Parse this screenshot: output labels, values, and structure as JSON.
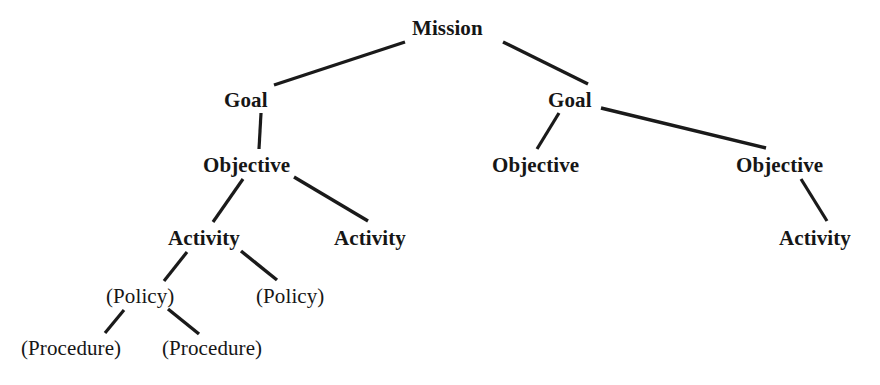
{
  "diagram": {
    "type": "tree",
    "line_color": "#1a1a1a",
    "text_color": "#161616",
    "background_color": "#ffffff",
    "levels": [
      "Mission",
      "Goal",
      "Objective",
      "Activity",
      "(Policy)",
      "(Procedure)"
    ],
    "nodes": [
      {
        "id": "mission",
        "label": "Mission",
        "level": 0,
        "style": "bold",
        "x": 412,
        "y": 18
      },
      {
        "id": "goal-1",
        "label": "Goal",
        "level": 1,
        "style": "bold",
        "x": 224,
        "y": 90
      },
      {
        "id": "goal-2",
        "label": "Goal",
        "level": 1,
        "style": "bold",
        "x": 548,
        "y": 90
      },
      {
        "id": "objective-1",
        "label": "Objective",
        "level": 2,
        "style": "bold",
        "x": 203,
        "y": 155
      },
      {
        "id": "objective-2",
        "label": "Objective",
        "level": 2,
        "style": "bold",
        "x": 492,
        "y": 155
      },
      {
        "id": "objective-3",
        "label": "Objective",
        "level": 2,
        "style": "bold",
        "x": 736,
        "y": 155
      },
      {
        "id": "activity-1",
        "label": "Activity",
        "level": 3,
        "style": "bold",
        "x": 168,
        "y": 228
      },
      {
        "id": "activity-2",
        "label": "Activity",
        "level": 3,
        "style": "bold",
        "x": 334,
        "y": 228
      },
      {
        "id": "activity-3",
        "label": "Activity",
        "level": 3,
        "style": "bold",
        "x": 779,
        "y": 228
      },
      {
        "id": "policy-1",
        "label": "(Policy)",
        "level": 4,
        "style": "plain",
        "x": 106,
        "y": 286
      },
      {
        "id": "policy-2",
        "label": "(Policy)",
        "level": 4,
        "style": "plain",
        "x": 256,
        "y": 286
      },
      {
        "id": "procedure-1",
        "label": "(Procedure)",
        "level": 5,
        "style": "plain",
        "x": 21,
        "y": 338
      },
      {
        "id": "procedure-2",
        "label": "(Procedure)",
        "level": 5,
        "style": "plain",
        "x": 162,
        "y": 338
      }
    ],
    "edges": [
      {
        "id": "edge-mission-goal-1",
        "from": "mission",
        "to": "goal-1",
        "x1": 405,
        "y1": 42,
        "x2": 274,
        "y2": 85,
        "width": 3.4
      },
      {
        "id": "edge-mission-goal-2",
        "from": "mission",
        "to": "goal-2",
        "x1": 503,
        "y1": 42,
        "x2": 588,
        "y2": 84,
        "width": 3.4
      },
      {
        "id": "edge-goal-1-objective-1",
        "from": "goal-1",
        "to": "objective-1",
        "x1": 261,
        "y1": 113,
        "x2": 259,
        "y2": 149,
        "width": 3.2
      },
      {
        "id": "edge-goal-2-objective-2",
        "from": "goal-2",
        "to": "objective-2",
        "x1": 559,
        "y1": 113,
        "x2": 537,
        "y2": 149,
        "width": 3.2
      },
      {
        "id": "edge-goal-2-objective-3",
        "from": "goal-2",
        "to": "objective-3",
        "x1": 601,
        "y1": 108,
        "x2": 766,
        "y2": 148,
        "width": 3.4
      },
      {
        "id": "edge-objective-1-activity-1",
        "from": "objective-1",
        "to": "activity-1",
        "x1": 243,
        "y1": 179,
        "x2": 213,
        "y2": 222,
        "width": 3.2
      },
      {
        "id": "edge-objective-1-activity-2",
        "from": "objective-1",
        "to": "activity-2",
        "x1": 294,
        "y1": 177,
        "x2": 368,
        "y2": 221,
        "width": 3.4
      },
      {
        "id": "edge-objective-3-activity-3",
        "from": "objective-3",
        "to": "activity-3",
        "x1": 801,
        "y1": 179,
        "x2": 827,
        "y2": 221,
        "width": 3.2
      },
      {
        "id": "edge-activity-1-policy-1",
        "from": "activity-1",
        "to": "policy-1",
        "x1": 187,
        "y1": 252,
        "x2": 164,
        "y2": 281,
        "width": 3.2
      },
      {
        "id": "edge-activity-1-policy-2",
        "from": "activity-1",
        "to": "policy-2",
        "x1": 241,
        "y1": 251,
        "x2": 277,
        "y2": 280,
        "width": 3.4
      },
      {
        "id": "edge-policy-1-procedure-1",
        "from": "policy-1",
        "to": "procedure-1",
        "x1": 124,
        "y1": 310,
        "x2": 105,
        "y2": 333,
        "width": 3.2
      },
      {
        "id": "edge-policy-1-procedure-2",
        "from": "policy-1",
        "to": "procedure-2",
        "x1": 168,
        "y1": 309,
        "x2": 199,
        "y2": 334,
        "width": 3.4
      }
    ]
  }
}
